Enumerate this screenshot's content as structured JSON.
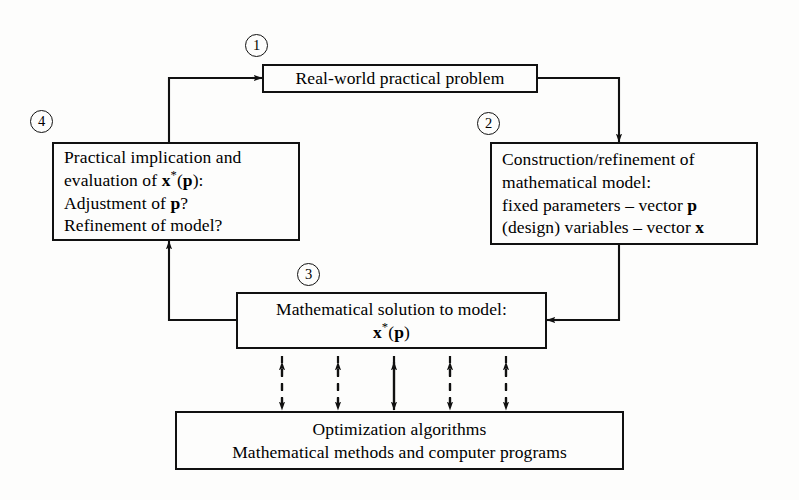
{
  "diagram": {
    "background_color": "#fdfdfc",
    "ink_color": "#111111",
    "markers": [
      {
        "id": "marker-1",
        "label": "1"
      },
      {
        "id": "marker-2",
        "label": "2"
      },
      {
        "id": "marker-3",
        "label": "3"
      },
      {
        "id": "marker-4",
        "label": "4"
      }
    ],
    "boxes": {
      "real_world": {
        "name": "real-world-problem-box",
        "lines": [
          "Real-world practical problem"
        ]
      },
      "practical_implication": {
        "name": "practical-implication-box",
        "lines": [
          "Practical implication and",
          "evaluation of x*(p):",
          "Adjustment of p?",
          "Refinement of model?"
        ]
      },
      "construction": {
        "name": "construction-refinement-box",
        "lines": [
          "Construction/refinement of",
          "mathematical model:",
          "fixed parameters – vector p",
          "(design) variables – vector x"
        ]
      },
      "math_solution": {
        "name": "mathematical-solution-box",
        "lines": [
          "Mathematical solution to model:",
          "x*(p)"
        ]
      },
      "algorithms": {
        "name": "optimization-algorithms-box",
        "lines": [
          "Optimization algorithms",
          "Mathematical methods and computer programs"
        ]
      }
    },
    "connectors": [
      {
        "name": "connector-implication-to-realworld",
        "style": "solid",
        "arrows": "single"
      },
      {
        "name": "connector-realworld-to-construction",
        "style": "solid",
        "arrows": "single"
      },
      {
        "name": "connector-construction-to-solution",
        "style": "solid",
        "arrows": "single"
      },
      {
        "name": "connector-solution-to-implication",
        "style": "solid",
        "arrows": "single"
      },
      {
        "name": "connector-solution-to-algorithms-1",
        "style": "dashed",
        "arrows": "double"
      },
      {
        "name": "connector-solution-to-algorithms-2",
        "style": "dashed",
        "arrows": "double"
      },
      {
        "name": "connector-solution-to-algorithms-3",
        "style": "solid",
        "arrows": "double"
      },
      {
        "name": "connector-solution-to-algorithms-4",
        "style": "dashed",
        "arrows": "double"
      },
      {
        "name": "connector-solution-to-algorithms-5",
        "style": "dashed",
        "arrows": "double"
      }
    ]
  }
}
